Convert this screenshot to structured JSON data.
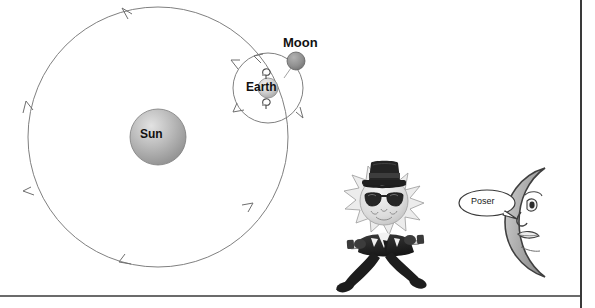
{
  "canvas": {
    "width": 595,
    "height": 308,
    "background": "#ffffff",
    "border_color": "#3a3a3a"
  },
  "diagram": {
    "title_labels": {
      "sun": "Sun",
      "earth": "Earth",
      "moon": "Moon"
    },
    "sun": {
      "label": "Sun",
      "cx": 158,
      "cy": 137,
      "r": 28,
      "fill_light": "#d8d8d8",
      "fill_dark": "#8e8e8e",
      "stroke": "#6e6e6e"
    },
    "earth": {
      "label": "Earth",
      "cx": 268,
      "cy": 88,
      "r": 10,
      "fill_light": "#e4e4e4",
      "fill_dark": "#a8a8a8",
      "stroke": "#7a7a7a"
    },
    "moon": {
      "label": "Moon",
      "cx": 296,
      "cy": 61,
      "r": 9,
      "fill": "#8f8f8f",
      "stroke": "#5d5d5d"
    },
    "earth_orbit": {
      "cx": 158,
      "cy": 137,
      "r": 130,
      "stroke": "#7d7d7d",
      "arrow_count": 5,
      "direction": "counterclockwise"
    },
    "moon_orbit": {
      "cx": 268,
      "cy": 88,
      "r": 35,
      "stroke": "#7d7d7d",
      "arrow_count": 3,
      "direction": "counterclockwise"
    },
    "rotation_arrows": {
      "above_earth": "curved-rotation-arrow",
      "below_earth": "curved-rotation-arrow"
    }
  },
  "cartoon": {
    "sun_character": {
      "name": "sun-character",
      "accessories": [
        "top-hat",
        "sunglasses",
        "suit",
        "bow-tie",
        "cane"
      ],
      "body_color": "#2b2b2b",
      "face_color": "#e9e9e9",
      "hat_color": "#1f1f1f",
      "glasses_color": "#262626"
    },
    "moon_character": {
      "name": "moon-character",
      "shape": "crescent",
      "fill": "#a9a9a9",
      "stroke": "#3d3d3d",
      "facing": "left"
    },
    "speech_bubble": {
      "text": "Poser",
      "fill": "#ffffff",
      "stroke": "#3a3a3a",
      "tail_direction": "right"
    }
  }
}
